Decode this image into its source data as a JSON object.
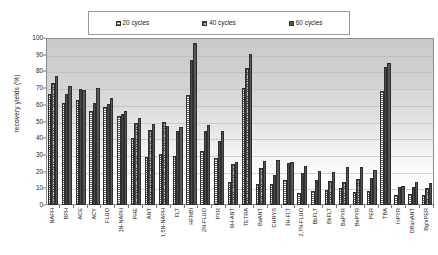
{
  "chart_data": {
    "type": "bar",
    "title": "",
    "xlabel": "",
    "ylabel": "recovery yields (%)",
    "ylim": [
      0,
      100
    ],
    "ytick_step": 10,
    "yticks": [
      100,
      90,
      80,
      70,
      60,
      50,
      40,
      30,
      20,
      10,
      0
    ],
    "grid": true,
    "legend_position": "top-center",
    "categories": [
      "NAPH",
      "BPH",
      "ACE",
      "ACY",
      "FLUO",
      "1N-NAPH",
      "PHE",
      "ANT",
      "1,5N-NAPH",
      "FLT",
      "HFNBI",
      "2N-FLUO",
      "PYR",
      "9H-ANT",
      "TETRA",
      "BaANT",
      "CHRYS",
      "3H-FLT",
      "2,7N-FLUO",
      "BbFLT",
      "BkFLT",
      "BaPYR",
      "BePYR",
      "PER",
      "TBA",
      "InPYR",
      "DBahANT",
      "BghiPER"
    ],
    "series": [
      {
        "name": "20 cycles",
        "swatch_color": "#ffffff",
        "pattern": "horizontal-lines",
        "values": [
          66.5,
          61,
          63,
          56.5,
          58.5,
          53.5,
          40,
          28.5,
          30.5,
          29.5,
          66,
          32.5,
          28,
          13.5,
          70,
          12.5,
          12.5,
          15,
          7,
          8.5,
          9,
          10,
          8,
          8.5,
          68,
          6,
          6.5,
          6
        ]
      },
      {
        "name": "40 cycles",
        "swatch_color": "#b9b9b9",
        "pattern": "cross-dots",
        "values": [
          73,
          66.5,
          69.5,
          61,
          60.5,
          54.5,
          49,
          45,
          50,
          44.5,
          87,
          44.5,
          38.5,
          24.5,
          82,
          22,
          18,
          25,
          19,
          15,
          14.5,
          14,
          15.5,
          16,
          82.5,
          11,
          10.5,
          10
        ]
      },
      {
        "name": "60 cycles",
        "swatch_color": "#575757",
        "pattern": "solid",
        "values": [
          77,
          71,
          69,
          70,
          64,
          56,
          52,
          48.5,
          47.5,
          47,
          97,
          48,
          44.5,
          25.5,
          90.5,
          26.5,
          27,
          25.5,
          23.5,
          20.5,
          19.5,
          23,
          23,
          21,
          85,
          11.5,
          14,
          13
        ]
      }
    ]
  },
  "legend": {
    "items": [
      {
        "label": "20 cycles"
      },
      {
        "label": "40 cycles"
      },
      {
        "label": "60 cycles"
      }
    ]
  },
  "axes": {
    "y_title": "recovery yields (%)"
  },
  "colors": {
    "plot_border": "#8c8c8c",
    "gridline": "#b4b4b4",
    "bar_outline": "#2e2e2e",
    "series_20": "#ffffff",
    "series_40": "#b9b9b9",
    "series_60": "#575757"
  }
}
